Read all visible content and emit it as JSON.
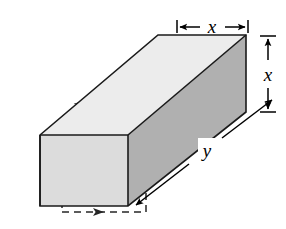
{
  "figure": {
    "background_color": "#ffffff"
  },
  "solid": {
    "name": "rectangular-prism",
    "faces": {
      "top": {
        "name": "top-face",
        "color": "#ececec"
      },
      "front": {
        "name": "front-face",
        "color": "#dcdcdc"
      },
      "right": {
        "name": "right-side-face",
        "color": "#b0b0b0"
      }
    },
    "edge_color": "#1a1a1a",
    "hidden_edge_color": "#262626"
  },
  "dimensions": [
    {
      "id": "width-top",
      "label": "x",
      "name": "dimension-x-top",
      "orientation": "horizontal",
      "position": "above-top-face",
      "style": "double-arrow-with-end-ticks"
    },
    {
      "id": "height-right",
      "label": "x",
      "name": "dimension-x-right",
      "orientation": "vertical",
      "position": "right-of-side-face",
      "style": "double-arrow-with-end-ticks"
    },
    {
      "id": "length-diagonal",
      "label": "y",
      "name": "dimension-y-diagonal",
      "orientation": "diagonal",
      "position": "lower-right-along-length",
      "style": "double-arrow"
    }
  ],
  "hidden_edges": [
    {
      "id": "back-top-diagonal",
      "name": "hidden-edge-back-top-diagonal",
      "arrow_count": 2,
      "arrow_direction": "up-right"
    },
    {
      "id": "back-top-horizontal",
      "name": "hidden-edge-back-top-horizontal",
      "arrow_count": 1,
      "arrow_direction": "left"
    },
    {
      "id": "back-left-vertical",
      "name": "hidden-edge-back-left-vertical",
      "arrow_count": 1,
      "arrow_direction": "down"
    },
    {
      "id": "back-bottom-horizontal",
      "name": "hidden-edge-back-bottom-horizontal",
      "arrow_count": 1,
      "arrow_direction": "right"
    },
    {
      "id": "back-right-vertical",
      "name": "hidden-edge-back-right-vertical",
      "arrow_count": 1,
      "arrow_direction": "up"
    }
  ]
}
